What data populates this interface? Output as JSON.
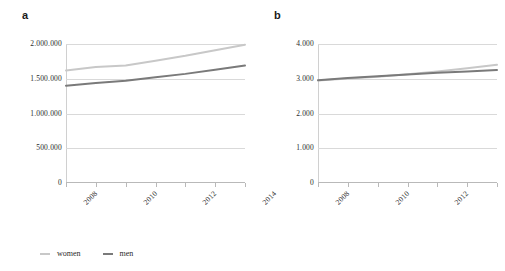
{
  "figure": {
    "background": "#ffffff",
    "panel_a_label": "a",
    "panel_b_label": "b"
  },
  "legend": {
    "items": [
      {
        "label": "women",
        "color": "#c8c8c8"
      },
      {
        "label": "men",
        "color": "#7a7a7a"
      }
    ]
  },
  "chart_data": [
    {
      "type": "line",
      "id": "a",
      "title": "a",
      "xlabel": "",
      "ylabel": "",
      "x": [
        2008,
        2009,
        2010,
        2011,
        2012,
        2013,
        2014
      ],
      "xticks_major": [
        "2008",
        "2010",
        "2012",
        "2014"
      ],
      "xticks_all": [
        "2008",
        "2009",
        "2010",
        "2011",
        "2012",
        "2013",
        "2014"
      ],
      "yticks": [
        "0",
        "500.000",
        "1.000.000",
        "1.500.000",
        "2.000.000"
      ],
      "ytick_values": [
        0,
        500000,
        1000000,
        1500000,
        2000000
      ],
      "ylim": [
        0,
        2000000
      ],
      "xlim": [
        2008,
        2014
      ],
      "grid": true,
      "legend_position": "bottom-left",
      "series": [
        {
          "name": "women",
          "color": "#c8c8c8",
          "values": [
            1620000,
            1670000,
            1690000,
            1760000,
            1830000,
            1910000,
            1990000
          ]
        },
        {
          "name": "men",
          "color": "#7a7a7a",
          "values": [
            1400000,
            1440000,
            1470000,
            1520000,
            1570000,
            1630000,
            1690000
          ]
        }
      ]
    },
    {
      "type": "line",
      "id": "b",
      "title": "b",
      "xlabel": "",
      "ylabel": "",
      "x": [
        2008,
        2009,
        2010,
        2011,
        2012,
        2013,
        2014
      ],
      "xticks_major": [
        "2008",
        "2010",
        "2012",
        "2014"
      ],
      "xticks_all": [
        "2008",
        "2009",
        "2010",
        "2011",
        "2012",
        "2013",
        "2014"
      ],
      "yticks": [
        "0",
        "1.000",
        "2.000",
        "3.000",
        "4.000"
      ],
      "ytick_values": [
        0,
        1000,
        2000,
        3000,
        4000
      ],
      "ylim": [
        0,
        4000
      ],
      "xlim": [
        2008,
        2014
      ],
      "grid": true,
      "legend_position": "bottom-left",
      "series": [
        {
          "name": "women",
          "color": "#c8c8c8",
          "values": [
            2950,
            3010,
            3060,
            3130,
            3210,
            3300,
            3400
          ]
        },
        {
          "name": "men",
          "color": "#7a7a7a",
          "values": [
            2960,
            3020,
            3070,
            3120,
            3170,
            3210,
            3250
          ]
        }
      ]
    }
  ]
}
